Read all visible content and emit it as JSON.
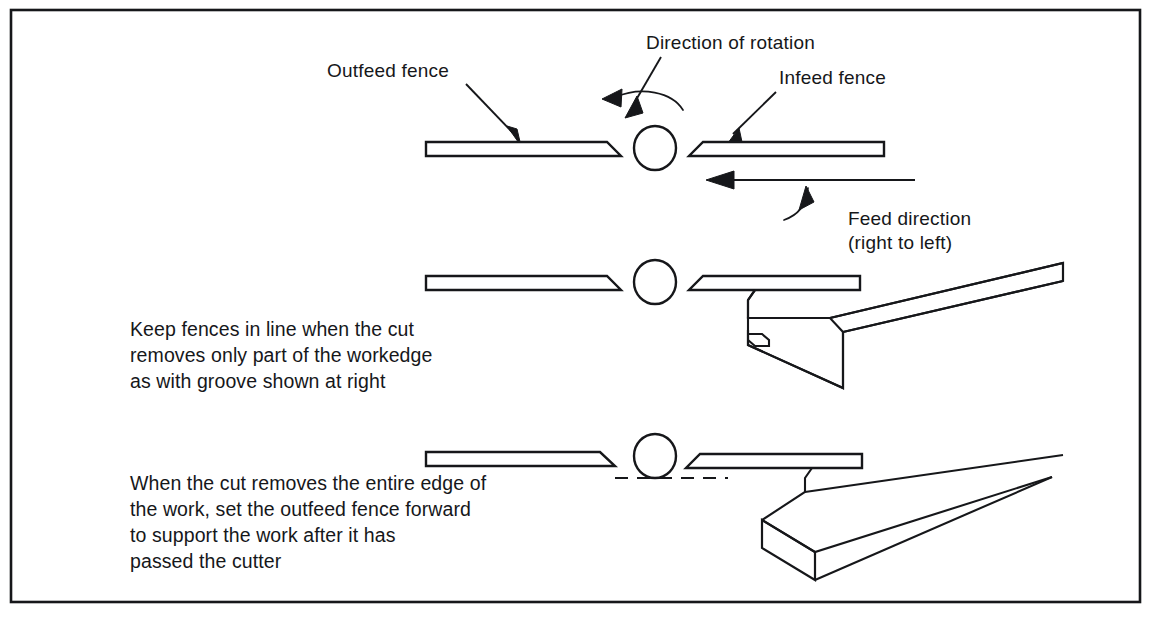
{
  "figure": {
    "background_color": "#ffffff",
    "ink_color": "#16171a",
    "border": true
  },
  "labels": {
    "direction_of_rotation": "Direction of rotation",
    "outfeed_fence": "Outfeed fence",
    "infeed_fence": "Infeed fence",
    "feed_direction_line1": "Feed direction",
    "feed_direction_line2": "(right to left)"
  },
  "captions": {
    "middle": [
      "Keep fences in line when the  cut",
      "removes only part of the workedge",
      "as with groove shown at right"
    ],
    "bottom": [
      "When the cut removes the  entire edge of",
      "the work, set the outfeed  fence forward",
      "to support the work after it   has",
      "passed the cutter"
    ]
  },
  "rows": [
    {
      "name": "top-row",
      "outfeed_fence_aligned": true,
      "infeed_fence_aligned": true,
      "has_cutter": true,
      "has_rotation_arrow": true,
      "has_feed_arrow": true,
      "has_workpiece": false,
      "has_dashed_reference": false
    },
    {
      "name": "middle-row",
      "outfeed_fence_aligned": true,
      "infeed_fence_aligned": true,
      "has_cutter": true,
      "has_rotation_arrow": false,
      "has_feed_arrow": false,
      "has_workpiece": true,
      "workpiece_has_groove": true,
      "has_dashed_reference": false
    },
    {
      "name": "bottom-row",
      "outfeed_fence_aligned": false,
      "outfeed_fence_offset": "forward",
      "infeed_fence_aligned": true,
      "has_cutter": true,
      "has_rotation_arrow": false,
      "has_feed_arrow": false,
      "has_workpiece": true,
      "workpiece_has_groove": false,
      "has_dashed_reference": true
    }
  ]
}
